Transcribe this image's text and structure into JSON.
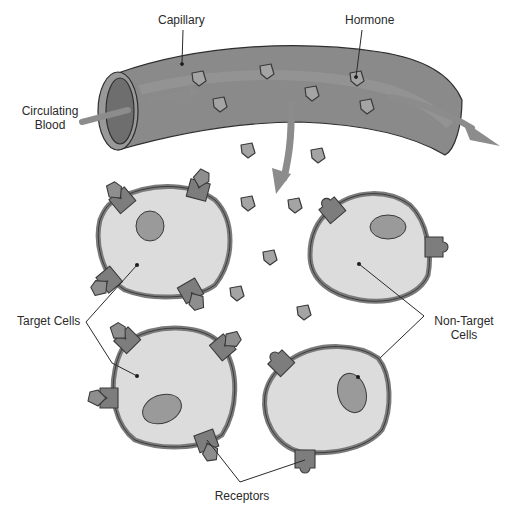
{
  "labels": {
    "capillary": "Capillary",
    "hormone": "Hormone",
    "circulating_blood_line1": "Circulating",
    "circulating_blood_line2": "Blood",
    "target_cells": "Target Cells",
    "non_target_line1": "Non-Target",
    "non_target_line2": "Cells",
    "receptors": "Receptors"
  },
  "colors": {
    "capillary": "#8a8a8a",
    "capillary_dark": "#6e6e6e",
    "arrow": "#8c8c8c",
    "membrane": "#8e8e8e",
    "cytoplasm": "#dcdcdc",
    "nucleus": "#9a9a9a",
    "hormone": "#a4a4a4",
    "receptor": "#7d7d7d",
    "outline": "#3a3a3a",
    "text": "#2a2a2a"
  },
  "cells": [
    {
      "name": "target-cell-top-left",
      "type": "target",
      "receptors": 4,
      "bound_hormones": 4
    },
    {
      "name": "target-cell-bottom-left",
      "type": "target",
      "receptors": 4,
      "bound_hormones": 4
    },
    {
      "name": "non-target-cell-top-right",
      "type": "non-target",
      "receptors": 2,
      "bound_hormones": 0
    },
    {
      "name": "non-target-cell-bottom-right",
      "type": "non-target",
      "receptors": 2,
      "bound_hormones": 0
    }
  ]
}
